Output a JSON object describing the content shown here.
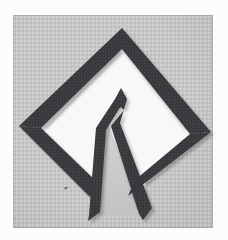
{
  "photo": {
    "alt": "Photograph of a dark charcoal cut-paper patch on a light gray woven fabric backdrop, framed by a white border: a diamond (rhombus) outline with a white interior containing an inverted-V chevron whose two legs extend down past the open bottom corner of the diamond",
    "subject": "diamond outline with inverted-V chevron",
    "backdrop": "light gray woven fabric",
    "border": "white photo border",
    "colors": {
      "paper_white": "#fcfcfc",
      "backdrop_gray": "#c8c8c8",
      "patch_dark": "#38383c",
      "interior_white": "#f8f8f8",
      "gap_gray": "#c9c9c9",
      "shadow_dark": "#2a2a2e"
    }
  }
}
